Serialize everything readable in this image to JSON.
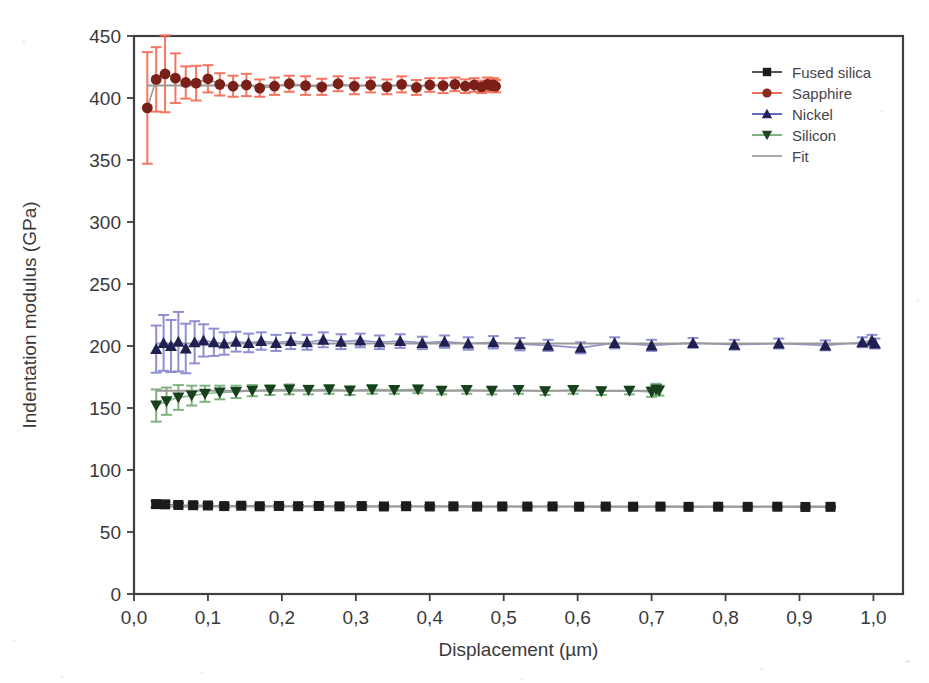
{
  "figure": {
    "background_color": "#ffffff",
    "frame_color": "#3f3f3f"
  },
  "chart_data": {
    "type": "scatter",
    "title": "",
    "xlabel": "Displacement (µm)",
    "ylabel": "Indentation modulus (GPa)",
    "xlim": [
      0.0,
      1.04
    ],
    "ylim": [
      0,
      450
    ],
    "xticks": [
      0.0,
      0.1,
      0.2,
      0.3,
      0.4,
      0.5,
      0.6,
      0.7,
      0.8,
      0.9,
      1.0
    ],
    "xticklabels": [
      "0,0",
      "0,1",
      "0,2",
      "0,3",
      "0,4",
      "0,5",
      "0,6",
      "0,7",
      "0,8",
      "0,9",
      "1,0"
    ],
    "yticks": [
      0,
      50,
      100,
      150,
      200,
      250,
      300,
      350,
      400,
      450
    ],
    "yticklabels": [
      "0",
      "50",
      "100",
      "150",
      "200",
      "250",
      "300",
      "350",
      "400",
      "450"
    ],
    "grid": false,
    "legend_position": "upper right",
    "decimal_separator": ",",
    "series": [
      {
        "name": "Fused silica",
        "marker": "square",
        "marker_color": "#1b1b1b",
        "line_color": "#6e6e5e",
        "error_color": "#2a2a2a",
        "fit_value": 70.5,
        "x": [
          0.03,
          0.042,
          0.06,
          0.08,
          0.1,
          0.122,
          0.145,
          0.17,
          0.196,
          0.222,
          0.25,
          0.278,
          0.308,
          0.338,
          0.368,
          0.4,
          0.432,
          0.464,
          0.498,
          0.532,
          0.566,
          0.602,
          0.638,
          0.675,
          0.712,
          0.75,
          0.79,
          0.83,
          0.87,
          0.908,
          0.942
        ],
        "y": [
          72.5,
          72.3,
          71.8,
          71.6,
          71.4,
          70.9,
          71.2,
          70.8,
          71.0,
          70.8,
          71.0,
          70.7,
          70.9,
          70.6,
          70.8,
          70.6,
          70.7,
          70.5,
          70.6,
          70.5,
          70.6,
          70.4,
          70.5,
          70.4,
          70.5,
          70.3,
          70.4,
          70.3,
          70.4,
          70.2,
          70.3
        ],
        "yerr": [
          2.6,
          2.2,
          1.8,
          1.6,
          1.4,
          1.3,
          1.2,
          1.1,
          1.1,
          1.0,
          1.0,
          1.0,
          0.9,
          0.9,
          0.9,
          0.9,
          0.8,
          0.8,
          0.8,
          0.8,
          0.8,
          0.8,
          0.8,
          0.7,
          0.7,
          0.7,
          0.7,
          0.7,
          0.7,
          0.7,
          0.7
        ]
      },
      {
        "name": "Sapphire",
        "marker": "circle",
        "marker_color": "#7a2018",
        "line_color": "#8a8a7a",
        "error_color": "#f4705c",
        "fit_value": 410.0,
        "x": [
          0.018,
          0.03,
          0.042,
          0.056,
          0.07,
          0.084,
          0.1,
          0.116,
          0.134,
          0.152,
          0.17,
          0.19,
          0.21,
          0.232,
          0.254,
          0.276,
          0.298,
          0.32,
          0.342,
          0.362,
          0.382,
          0.4,
          0.418,
          0.434,
          0.448,
          0.46,
          0.47,
          0.478,
          0.483,
          0.486,
          0.489
        ],
        "y": [
          392.0,
          415.0,
          419.5,
          416.0,
          412.5,
          412.0,
          415.5,
          411.0,
          409.5,
          410.5,
          408.0,
          409.5,
          411.5,
          410.0,
          409.0,
          411.5,
          409.5,
          410.5,
          409.0,
          411.0,
          408.5,
          410.5,
          410.0,
          411.0,
          409.5,
          410.5,
          409.0,
          411.0,
          410.0,
          410.5,
          409.5
        ],
        "yerr": [
          45.0,
          26.0,
          31.0,
          20.0,
          13.0,
          14.0,
          11.0,
          9.0,
          8.5,
          9.0,
          7.0,
          7.0,
          6.5,
          7.5,
          6.5,
          6.0,
          6.5,
          6.0,
          6.0,
          6.5,
          6.0,
          5.5,
          6.0,
          5.5,
          5.5,
          5.5,
          5.0,
          5.5,
          5.0,
          5.5,
          5.0
        ]
      },
      {
        "name": "Nickel",
        "marker": "triangle-up",
        "marker_color": "#1f1f52",
        "line_color": "#7f7fc4",
        "error_color": "#8a8ad2",
        "fit_value": 202.0,
        "x": [
          0.03,
          0.04,
          0.05,
          0.06,
          0.07,
          0.082,
          0.094,
          0.108,
          0.122,
          0.138,
          0.155,
          0.172,
          0.192,
          0.212,
          0.234,
          0.256,
          0.28,
          0.306,
          0.332,
          0.36,
          0.39,
          0.42,
          0.452,
          0.486,
          0.522,
          0.56,
          0.604,
          0.65,
          0.7,
          0.756,
          0.812,
          0.872,
          0.935,
          0.985,
          0.998,
          1.002
        ],
        "y": [
          197.5,
          202.5,
          200.0,
          203.5,
          198.0,
          203.0,
          204.5,
          203.0,
          202.0,
          203.5,
          202.5,
          204.0,
          202.5,
          204.0,
          203.0,
          205.0,
          203.5,
          204.5,
          203.0,
          204.0,
          202.5,
          203.5,
          202.0,
          203.0,
          201.5,
          200.5,
          198.5,
          202.5,
          200.5,
          202.5,
          201.0,
          202.0,
          200.5,
          203.0,
          204.5,
          202.0
        ],
        "yerr": [
          19.0,
          22.5,
          21.0,
          24.0,
          20.0,
          17.0,
          13.0,
          11.0,
          9.0,
          8.0,
          7.5,
          7.0,
          6.5,
          6.5,
          6.0,
          6.0,
          6.0,
          5.5,
          5.5,
          5.5,
          5.0,
          5.0,
          5.0,
          5.0,
          5.0,
          4.5,
          4.5,
          4.5,
          4.5,
          4.0,
          4.0,
          4.0,
          4.0,
          4.0,
          4.5,
          4.0
        ]
      },
      {
        "name": "Silicon",
        "marker": "triangle-down",
        "marker_color": "#17401c",
        "line_color": "#7aa87a",
        "error_color": "#79b07a",
        "fit_value": 164.0,
        "x": [
          0.03,
          0.044,
          0.06,
          0.078,
          0.096,
          0.116,
          0.138,
          0.16,
          0.184,
          0.21,
          0.236,
          0.264,
          0.292,
          0.322,
          0.352,
          0.384,
          0.416,
          0.45,
          0.484,
          0.52,
          0.556,
          0.594,
          0.632,
          0.67,
          0.7,
          0.706,
          0.71
        ],
        "y": [
          152.0,
          155.5,
          158.5,
          160.0,
          161.5,
          162.5,
          163.0,
          164.0,
          164.5,
          165.0,
          164.5,
          165.0,
          164.0,
          165.0,
          164.5,
          165.0,
          164.0,
          164.5,
          164.0,
          164.5,
          163.5,
          164.5,
          163.5,
          164.0,
          163.0,
          165.0,
          164.0
        ],
        "yerr": [
          13.0,
          11.0,
          10.0,
          8.0,
          6.5,
          5.5,
          5.0,
          4.5,
          4.0,
          4.0,
          3.5,
          3.5,
          3.5,
          3.5,
          3.0,
          3.0,
          3.0,
          3.0,
          3.0,
          3.0,
          3.0,
          3.0,
          3.0,
          3.0,
          4.0,
          4.5,
          4.0
        ]
      }
    ],
    "fit_series": {
      "name": "Fit",
      "color": "#9a9a9a"
    }
  },
  "legend": {
    "entries": [
      {
        "label": "Fused silica",
        "marker": "square",
        "color": "#1b1b1b",
        "line_color": "#555555"
      },
      {
        "label": "Sapphire",
        "marker": "circle",
        "color": "#8a2a1e",
        "line_color": "#e8705c"
      },
      {
        "label": "Nickel",
        "marker": "triangle-up",
        "color": "#23235e",
        "line_color": "#6a6ac0"
      },
      {
        "label": "Silicon",
        "marker": "triangle-down",
        "color": "#1d4a22",
        "line_color": "#7fb37f"
      },
      {
        "label": "Fit",
        "marker": "line",
        "color": "#a8a8a8",
        "line_color": "#a8a8a8"
      }
    ]
  }
}
